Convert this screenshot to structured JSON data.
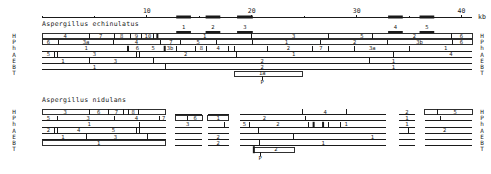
{
  "scale": {
    "unit_label": "kb",
    "range_kb": [
      0,
      41
    ],
    "major_ticks": [
      {
        "kb": 10,
        "label": "10"
      },
      {
        "kb": 20,
        "label": "20"
      },
      {
        "kb": 30,
        "label": "30"
      },
      {
        "kb": 40,
        "label": "40"
      }
    ],
    "minor_ticks": [
      0,
      5,
      15,
      25,
      35
    ],
    "gene_blocks": [
      {
        "label": "1",
        "start": 12.8,
        "end": 14.2
      },
      {
        "label": "2",
        "start": 15.6,
        "end": 17.0
      },
      {
        "label": "3",
        "start": 18.6,
        "end": 20.1
      },
      {
        "label": "4",
        "start": 33.0,
        "end": 34.4
      },
      {
        "label": "5",
        "start": 36.0,
        "end": 37.4
      }
    ]
  },
  "enzymes": [
    "H",
    "P",
    "h",
    "A",
    "E",
    "B",
    "T"
  ],
  "sections": [
    {
      "id": "echinulatus",
      "title": "Aspergillus echinulatus",
      "tracks": {
        "H": {
          "type": "box",
          "span": [
            0,
            41
          ],
          "cuts": [
            4.5,
            6.9,
            8.4,
            9.5,
            10.6
          ],
          "thick": [
            11
          ],
          "labels": [
            {
              "at": 2.2,
              "t": "4"
            },
            {
              "at": 5.6,
              "t": "7"
            },
            {
              "at": 7.6,
              "t": "8"
            },
            {
              "at": 9.0,
              "t": "9"
            },
            {
              "at": 10.1,
              "t": "10"
            },
            {
              "at": 15.5,
              "t": "1"
            },
            {
              "at": 24,
              "t": "3"
            },
            {
              "at": 30.5,
              "t": "5"
            },
            {
              "at": 35.5,
              "t": "2"
            },
            {
              "at": 40,
              "t": "6"
            }
          ],
          "extra_cuts": [
            20,
            27.3,
            31.5,
            39.0
          ]
        },
        "P": {
          "type": "box",
          "span": [
            0,
            41
          ],
          "cuts": [
            1.6,
            6.8,
            11.3,
            13.2,
            16.6,
            20.1,
            26.6,
            32.9,
            39.1
          ],
          "labels": [
            {
              "at": 0.6,
              "t": "6"
            },
            {
              "at": 4.2,
              "t": "3a"
            },
            {
              "at": 9.0,
              "t": "4"
            },
            {
              "at": 12.3,
              "t": "7"
            },
            {
              "at": 14.9,
              "t": "5"
            },
            {
              "at": 23.3,
              "t": "1"
            },
            {
              "at": 29.8,
              "t": "2"
            },
            {
              "at": 36.0,
              "t": "3b"
            },
            {
              "at": 40,
              "t": "6"
            }
          ]
        },
        "h": {
          "type": "line",
          "span": [
            0,
            41
          ],
          "cuts": [
            12.8,
            14.6,
            15.7,
            17.8,
            18.4,
            21.5,
            25.8,
            27.3,
            29.8,
            35.0,
            41
          ],
          "thick": [
            8.2,
            11.7
          ],
          "labels": [
            {
              "at": 4.2,
              "t": "1"
            },
            {
              "at": 9.1,
              "t": "6"
            },
            {
              "at": 10.6,
              "t": "5"
            },
            {
              "at": 12.2,
              "t": "3b"
            },
            {
              "at": 15.2,
              "t": "8"
            },
            {
              "at": 16.8,
              "t": "4"
            },
            {
              "at": 23.5,
              "t": "2"
            },
            {
              "at": 26.6,
              "t": "7"
            },
            {
              "at": 31.5,
              "t": "3a"
            },
            {
              "at": 38.5,
              "t": "1"
            }
          ]
        },
        "A": {
          "type": "line",
          "span": [
            0,
            41
          ],
          "cuts": [
            1.2,
            1.5,
            9.0,
            9.3,
            18.5,
            33.5
          ],
          "labels": [
            {
              "at": 0.6,
              "t": "5"
            },
            {
              "at": 5.0,
              "t": "3"
            },
            {
              "at": 13.7,
              "t": "2"
            },
            {
              "at": 24.0,
              "t": "1"
            },
            {
              "at": 39.0,
              "t": "4"
            }
          ]
        },
        "E": {
          "type": "line",
          "span": [
            0,
            41
          ],
          "cuts": [
            4.5,
            10.6,
            31.2
          ],
          "labels": [
            {
              "at": 2.0,
              "t": "1"
            },
            {
              "at": 7.0,
              "t": "3"
            },
            {
              "at": 21.0,
              "t": "2"
            },
            {
              "at": 33.5,
              "t": "1"
            }
          ]
        },
        "B": {
          "type": "line",
          "span": [
            0,
            41
          ],
          "cuts": [
            11.8,
            41
          ],
          "labels": [
            {
              "at": 5.0,
              "t": "1"
            },
            {
              "at": 21.0,
              "t": "2"
            },
            {
              "at": 33.5,
              "t": "1"
            }
          ]
        },
        "T": {
          "type": "subbox",
          "span": [
            18.4,
            24.8
          ],
          "labels": [
            {
              "at": 21.0,
              "t": "1a"
            }
          ],
          "marker": {
            "at": 21.0,
            "t": "P"
          }
        }
      }
    },
    {
      "id": "nidulans",
      "title": "Aspergillus nidulans",
      "segments": [
        [
          0,
          11.8
        ],
        [
          12.7,
          15.3
        ],
        [
          15.8,
          17.8
        ],
        [
          18.9,
          32.8
        ],
        [
          34.0,
          35.6
        ],
        [
          36.5,
          41
        ]
      ],
      "tracks": {
        "H": {
          "type": "box",
          "span": [
            0,
            11.8
          ],
          "cuts": [
            4.5,
            6.3,
            7.8,
            8.2,
            9.2
          ],
          "labels": [
            {
              "at": 2.2,
              "t": "3"
            },
            {
              "at": 5.4,
              "t": "6"
            },
            {
              "at": 7.1,
              "t": "7"
            },
            {
              "at": 8.7,
              "t": "8"
            }
          ],
          "others": [
            {
              "seg": 3,
              "cuts": [
                24.8,
                29.0
              ],
              "labels": [
                {
                  "at": 27.0,
                  "t": "4"
                }
              ]
            },
            {
              "seg": 4,
              "labels": [
                {
                  "at": 34.8,
                  "t": "2"
                }
              ]
            },
            {
              "seg": 5,
              "box": true,
              "cuts": [
                37.7
              ],
              "labels": [
                {
                  "at": 39.4,
                  "t": "5"
                }
              ]
            }
          ]
        },
        "P": {
          "type": "line",
          "span": [
            0,
            11.8
          ],
          "cuts": [
            1.5,
            6.9,
            11.2
          ],
          "labels": [
            {
              "at": 0.6,
              "t": "5"
            },
            {
              "at": 4.4,
              "t": "3"
            },
            {
              "at": 9.0,
              "t": "4"
            },
            {
              "at": 11.6,
              "t": "7"
            }
          ],
          "others": [
            {
              "seg": 1,
              "box": true,
              "cuts": [
                13.9
              ],
              "labels": [
                {
                  "at": 14.6,
                  "t": "6"
                }
              ]
            },
            {
              "seg": 2,
              "box": true,
              "labels": [
                {
                  "at": 16.8,
                  "t": "1"
                }
              ]
            },
            {
              "seg": 3,
              "cuts": [
                25.1
              ],
              "labels": [
                {
                  "at": 21.2,
                  "t": "2"
                }
              ]
            },
            {
              "seg": 4,
              "labels": [
                {
                  "at": 34.8,
                  "t": "1"
                }
              ]
            },
            {
              "seg": 5,
              "cuts": [
                38.0
              ]
            }
          ]
        },
        "h": {
          "type": "line",
          "span": [
            0,
            11.8
          ],
          "cuts": [
            9.3
          ],
          "labels": [
            {
              "at": 4.5,
              "t": "1"
            }
          ],
          "others": [
            {
              "seg": 1,
              "labels": [
                {
                  "at": 13.9,
                  "t": "3"
                }
              ]
            },
            {
              "seg": 2,
              "cuts": [
                17.4
              ]
            },
            {
              "seg": 3,
              "cuts": [
                19.8,
                25.4,
                27.3,
                28.5
              ],
              "thick": [
                25.9,
                26.8
              ],
              "labels": [
                {
                  "at": 19.3,
                  "t": "5"
                },
                {
                  "at": 22.5,
                  "t": "2"
                },
                {
                  "at": 29.0,
                  "t": "1"
                }
              ]
            },
            {
              "seg": 4,
              "labels": [
                {
                  "at": 34.8,
                  "t": "1"
                }
              ]
            }
          ]
        },
        "A": {
          "type": "line",
          "span": [
            0,
            11.8
          ],
          "cuts": [
            1.2,
            1.5,
            9.0,
            9.3
          ],
          "labels": [
            {
              "at": 0.6,
              "t": "2"
            },
            {
              "at": 3.5,
              "t": "4"
            },
            {
              "at": 6.8,
              "t": "5"
            }
          ],
          "others": [
            {
              "seg": 3,
              "cuts": [
                20.6
              ]
            },
            {
              "seg": 4,
              "cuts": [
                34.9
              ]
            },
            {
              "seg": 5,
              "labels": [
                {
                  "at": 38.4,
                  "t": "2"
                }
              ]
            }
          ]
        },
        "E": {
          "type": "line",
          "span": [
            0,
            11.8
          ],
          "cuts": [
            4.2,
            10.1
          ],
          "labels": [
            {
              "at": 2.0,
              "t": "1"
            },
            {
              "at": 7.0,
              "t": "3"
            }
          ],
          "others": [
            {
              "seg": 2,
              "labels": [
                {
                  "at": 16.8,
                  "t": "2"
                }
              ]
            },
            {
              "seg": 3,
              "cuts": [
                24.0
              ],
              "labels": [
                {
                  "at": 31.5,
                  "t": "1"
                }
              ]
            }
          ]
        },
        "B": {
          "type": "box",
          "span": [
            0,
            11.8
          ],
          "labels": [
            {
              "at": 5.4,
              "t": "1"
            }
          ],
          "others": [
            {
              "seg": 2,
              "labels": [
                {
                  "at": 16.8,
                  "t": "2"
                }
              ]
            },
            {
              "seg": 3,
              "cuts": [
                20.7
              ],
              "labels": [
                {
                  "at": 26.8,
                  "t": "1"
                }
              ]
            }
          ]
        },
        "T": {
          "type": "subbox",
          "span": [
            20.2,
            24.1
          ],
          "thick_start": true,
          "labels": [
            {
              "at": 22.3,
              "t": "2"
            }
          ],
          "marker": {
            "at": 20.8,
            "t": "P"
          }
        }
      }
    }
  ]
}
